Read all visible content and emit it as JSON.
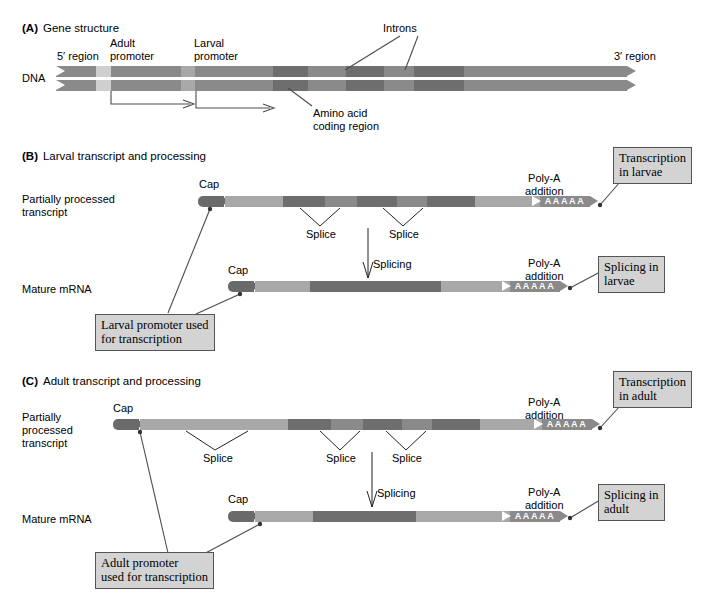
{
  "panels": [
    {
      "letter": "(A)",
      "title": "Gene structure",
      "row_label": "DNA",
      "labels": {
        "five_prime": "5′ region",
        "three_prime": "3′ region",
        "adult_promoter": "Adult\npromoter",
        "larval_promoter": "Larval\npromoter",
        "introns": "Introns",
        "coding": "Amino acid\ncoding region"
      }
    },
    {
      "letter": "(B)",
      "title": "Larval transcript and processing",
      "rows": [
        {
          "label": "Partially processed\ntranscript"
        },
        {
          "label": "Mature mRNA"
        }
      ],
      "labels": {
        "cap": "Cap",
        "polya": "Poly-A\naddition",
        "splice": "Splice",
        "splicing": "Splicing",
        "polya_letters": "AAAAA"
      },
      "callouts": {
        "transcription": "Transcription\nin larvae",
        "splicing": "Splicing in\nlarvae",
        "promoter": "Larval promoter used\nfor transcription"
      }
    },
    {
      "letter": "(C)",
      "title": "Adult transcript and processing",
      "rows": [
        {
          "label": "Partially\nprocessed\ntranscript"
        },
        {
          "label": "Mature mRNA"
        }
      ],
      "labels": {
        "cap": "Cap",
        "polya": "Poly-A\naddition",
        "splice": "Splice",
        "splicing": "Splicing",
        "polya_letters": "AAAAA"
      },
      "callouts": {
        "transcription": "Transcription\nin adult",
        "splicing": "Splicing in\nadult",
        "promoter": "Adult promoter\nused for transcription"
      }
    }
  ],
  "colors": {
    "background": "#ffffff",
    "strand_dark": "#6e6e6e",
    "strand_mid": "#8a8a8a",
    "strand_light": "#a8a8a8",
    "strand_pale": "#cfcfcf",
    "callout_fill": "#d3d3d3",
    "callout_border": "#555555",
    "leader_line": "#4a4a55",
    "text": "#000000"
  }
}
